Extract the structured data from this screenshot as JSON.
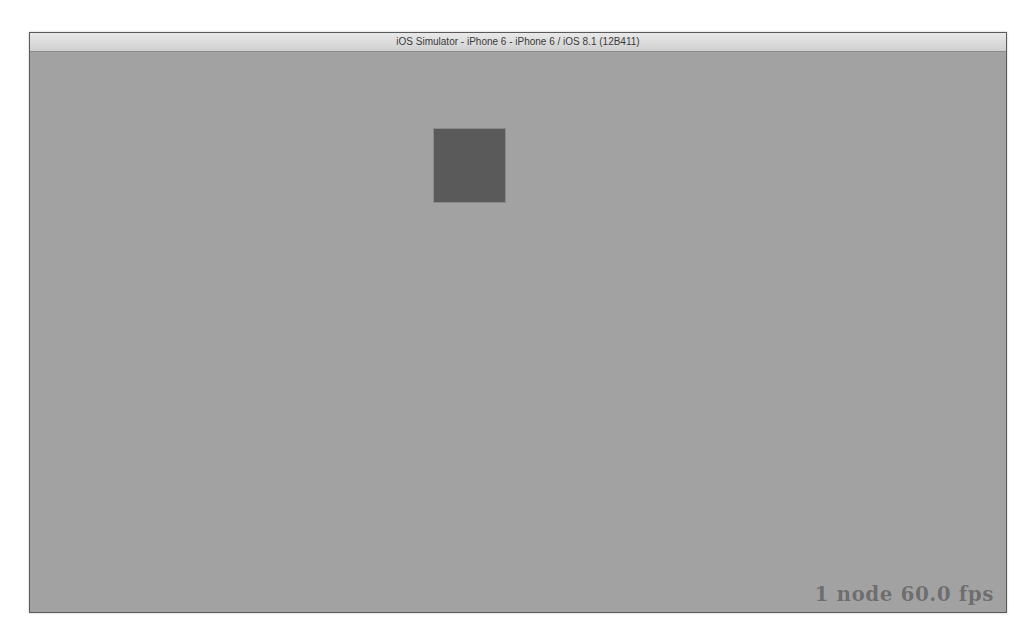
{
  "window": {
    "title": "iOS Simulator - iPhone 6 - iPhone 6 / iOS 8.1 (12B411)"
  },
  "scene": {
    "background_color": "#a2a2a2",
    "sprite": {
      "shape": "square",
      "color": "#5a5a5a"
    },
    "stats_overlay": "1 node 60.0 fps"
  }
}
